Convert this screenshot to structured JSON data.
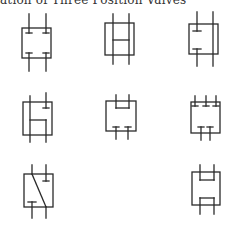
{
  "title": "ation of Three Position Valves",
  "symbols": [
    {
      "id": 1,
      "description": "Center position: all ports blocked (two top, two bottom tee-blocked)"
    },
    {
      "id": 2,
      "description": "Center position: all ports interconnected (open center, tandem H)"
    },
    {
      "id": 3,
      "description": "Center position: one path open straight through, other blocked"
    },
    {
      "id": 4,
      "description": "Center position: L-shaped connection, one port blocked"
    },
    {
      "id": 5,
      "description": "Center position: top ports connected, bottom ports blocked"
    },
    {
      "id": 6,
      "description": "Center position: three top ports blocked, two bottom ports blocked"
    },
    {
      "id": 7,
      "description": "Center position: diagonal crossover, two ports blocked"
    },
    {
      "id": 8,
      "description": "Center position: top ports connected, bottom ports connected"
    }
  ],
  "colors": {
    "line": "#2a2a2a",
    "background": "#ffffff"
  }
}
